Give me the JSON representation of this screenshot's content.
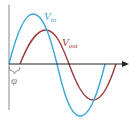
{
  "diagram": {
    "type": "phase-shift waveform",
    "colors": {
      "v_in": "#3aa6d6",
      "v_out": "#9e3a3a",
      "axis": "#222222",
      "vertical_axis": "#888888",
      "phi": "#888888"
    },
    "labels": {
      "v_in_main": "V",
      "v_in_sub": "in",
      "v_out_main": "V",
      "v_out_sub": "out",
      "phase": "φ"
    }
  }
}
